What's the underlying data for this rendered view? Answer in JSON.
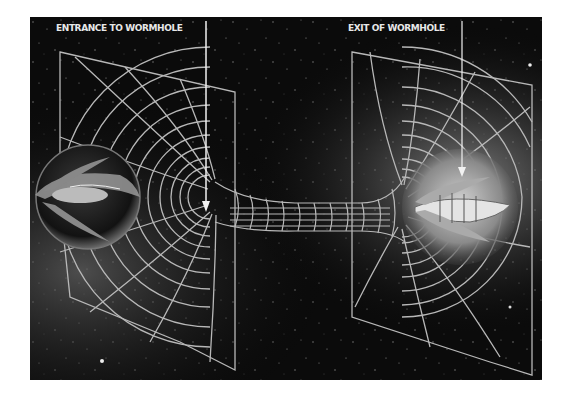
{
  "diagram": {
    "labels": {
      "entrance": "ENTRANCE TO WORMHOLE",
      "exit": "EXIT OF WORMHOLE"
    },
    "elements": [
      {
        "name": "entrance-grid-panel",
        "description": "curved spacetime grid funnel, left"
      },
      {
        "name": "exit-grid-panel",
        "description": "curved spacetime grid funnel, right"
      },
      {
        "name": "wormhole-throat",
        "description": "tubular grid tunnel connecting both funnels"
      },
      {
        "name": "spaceship-entrance",
        "description": "spaceship inside dark sphere at entrance"
      },
      {
        "name": "spaceship-exit",
        "description": "spaceship inside glowing sphere at exit"
      }
    ],
    "colors": {
      "background": "#0b0b0b",
      "grid": "#b8b8b8",
      "label": "#e8e8e8",
      "arrow": "#f2f2f2",
      "page": "#ffffff"
    }
  }
}
